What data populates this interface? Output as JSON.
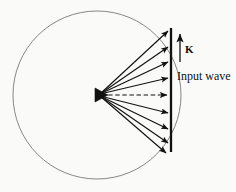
{
  "figure": {
    "kind": "physics-diagram",
    "background_color": "#fafaf8",
    "ink_color": "#111111",
    "circle_line_color": "#6b6b6b",
    "labels": {
      "k_vector": "K",
      "input_wave": "Input wave"
    },
    "circle": {
      "center_x": 97,
      "center_y": 95,
      "radius": 84,
      "stroke_width": 0.8
    },
    "apex": {
      "x": 98,
      "y": 95,
      "marker": "filled-triangle"
    },
    "vertical_line": {
      "x": 171,
      "y_top": 28,
      "y_bottom": 152,
      "stroke_width": 2.2
    },
    "k_arrow": {
      "x": 180,
      "y_tail": 62,
      "y_head": 33,
      "direction": "up"
    },
    "rays": [
      {
        "index": 1,
        "end_x": 170,
        "end_y": 31,
        "style": "solid"
      },
      {
        "index": 2,
        "end_x": 170,
        "end_y": 46,
        "style": "solid"
      },
      {
        "index": 3,
        "end_x": 170,
        "end_y": 61,
        "style": "solid"
      },
      {
        "index": 4,
        "end_x": 170,
        "end_y": 77,
        "style": "solid"
      },
      {
        "index": 5,
        "end_x": 170,
        "end_y": 95,
        "style": "dashed"
      },
      {
        "index": 6,
        "end_x": 170,
        "end_y": 113,
        "style": "solid"
      },
      {
        "index": 7,
        "end_x": 170,
        "end_y": 128,
        "style": "solid"
      },
      {
        "index": 8,
        "end_x": 170,
        "end_y": 142,
        "style": "solid"
      },
      {
        "index": 9,
        "end_x": 170,
        "end_y": 152,
        "style": "solid"
      }
    ]
  }
}
